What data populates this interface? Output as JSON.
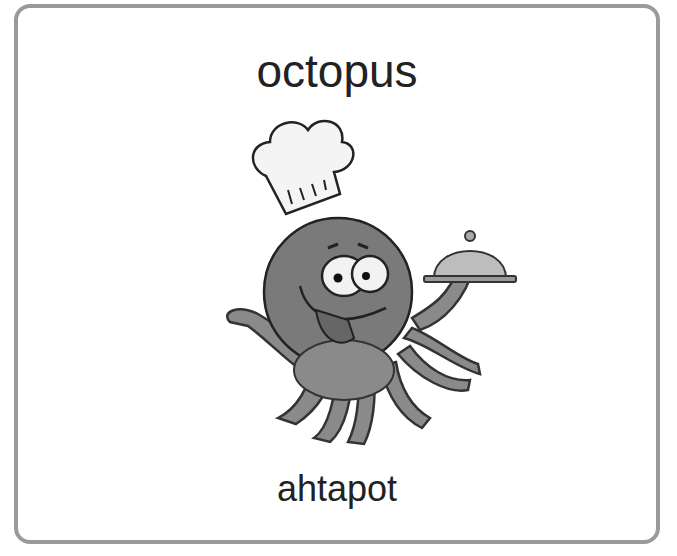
{
  "card": {
    "word": "octopus",
    "translation": "ahtapot",
    "illustration": "chef-octopus-with-cloche",
    "colors": {
      "border": "#9a9a9a",
      "octopus_body": "#7a7a7a",
      "cloche": "#bdbdbd",
      "text": "#222222"
    }
  }
}
